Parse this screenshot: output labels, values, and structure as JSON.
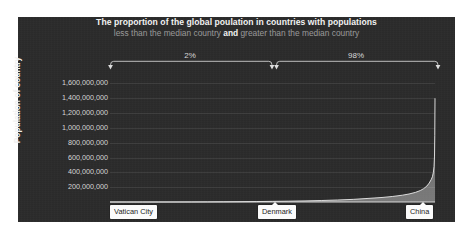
{
  "figure": {
    "background": "#ffffff",
    "panel_color": "#2b2b2b",
    "accent_text": "#f2f2f2",
    "muted_text": "#9a9a9a"
  },
  "title": "The proportion of the global poulation in countries with populations",
  "subtitle": {
    "before": "less than the median country ",
    "conjunction": "and",
    "after": " greater than the median country"
  },
  "annotations": {
    "left_bracket_label": "2%",
    "right_bracket_label": "98%"
  },
  "callouts": [
    {
      "name": "vatican-city",
      "label": "Vatican City"
    },
    {
      "name": "denmark",
      "label": "Denmark"
    },
    {
      "name": "china",
      "label": "China"
    }
  ],
  "chart_data": {
    "type": "area",
    "title": "The proportion of the global poulation in countries with populations less than the median country and greater than the median country",
    "xlabel": "",
    "ylabel": "Population of country",
    "ylim": [
      0,
      1700000000
    ],
    "xlim": [
      0,
      1
    ],
    "grid": true,
    "legend": null,
    "ytick_labels": [
      "1,600,000,000",
      "1,400,000,000",
      "1,200,000,000",
      "1,000,000,000",
      "800,000,000",
      "600,000,000",
      "400,000,000",
      "200,000,000"
    ],
    "ytick_values": [
      1600000000,
      1400000000,
      1200000000,
      1000000000,
      800000000,
      600000000,
      400000000,
      200000000
    ],
    "xtick_labels": [
      "Vatican City",
      "Denmark",
      "China"
    ],
    "series": [
      {
        "name": "Population of country",
        "x": [
          0.0,
          0.05,
          0.1,
          0.15,
          0.2,
          0.25,
          0.3,
          0.35,
          0.4,
          0.45,
          0.5,
          0.55,
          0.6,
          0.65,
          0.7,
          0.75,
          0.8,
          0.84,
          0.87,
          0.9,
          0.92,
          0.94,
          0.955,
          0.965,
          0.975,
          0.982,
          0.988,
          0.992,
          0.995,
          0.997,
          0.9985,
          0.9993,
          1.0
        ],
        "values": [
          800,
          10000,
          60000,
          180000,
          400000,
          800000,
          1500000,
          2600000,
          4200000,
          6000000,
          8500000,
          11000000,
          15000000,
          20000000,
          27000000,
          36000000,
          50000000,
          62000000,
          75000000,
          92000000,
          108000000,
          130000000,
          155000000,
          180000000,
          215000000,
          255000000,
          300000000,
          340000000,
          400000000,
          480000000,
          620000000,
          900000000,
          1400000000
        ]
      }
    ],
    "markers": [
      {
        "label": "Vatican City",
        "x": 0.0,
        "value": 800
      },
      {
        "label": "Denmark",
        "x": 0.5,
        "value": 5800000
      },
      {
        "label": "China",
        "x": 1.0,
        "value": 1400000000
      }
    ],
    "brackets": [
      {
        "label": "2%",
        "from_x": 0.0,
        "to_x": 0.5,
        "meaning": "share of global population in countries below the median"
      },
      {
        "label": "98%",
        "from_x": 0.5,
        "to_x": 1.0,
        "meaning": "share of global population in countries above the median"
      }
    ]
  }
}
